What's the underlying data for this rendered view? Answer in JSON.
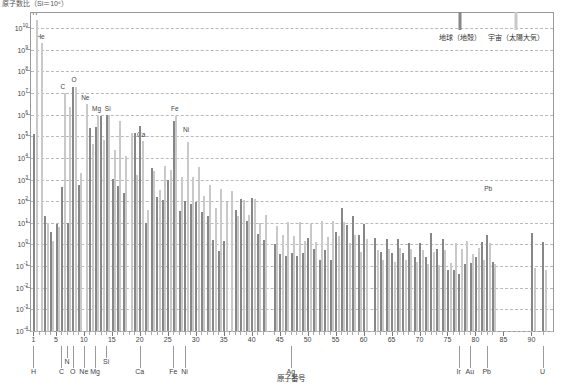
{
  "chart_title": "原子数比（Si＝10⁶）",
  "xaxis_title": "原子番号",
  "legend": {
    "items": [
      {
        "label": "地球（地殻）",
        "color": "#878787",
        "key": "earth"
      },
      {
        "label": "宇宙（太陽大気）",
        "color": "#c9c9c9",
        "key": "solar"
      }
    ]
  },
  "y_ticks": [
    {
      "mantissa": "10",
      "exp": "10"
    },
    {
      "mantissa": "10",
      "exp": "9"
    },
    {
      "mantissa": "10",
      "exp": "8"
    },
    {
      "mantissa": "10",
      "exp": "7"
    },
    {
      "mantissa": "10",
      "exp": "6"
    },
    {
      "mantissa": "10",
      "exp": "5"
    },
    {
      "mantissa": "10",
      "exp": "4"
    },
    {
      "mantissa": "10",
      "exp": "3"
    },
    {
      "mantissa": "10",
      "exp": "2"
    },
    {
      "mantissa": "10",
      "exp": "1"
    },
    {
      "mantissa": "10",
      "exp": "0"
    },
    {
      "mantissa": "10",
      "exp": "-1"
    },
    {
      "mantissa": "10",
      "exp": "-2"
    },
    {
      "mantissa": "10",
      "exp": "-3"
    },
    {
      "mantissa": "10",
      "exp": "-4"
    }
  ],
  "x_ticks": [
    1,
    5,
    10,
    15,
    20,
    25,
    30,
    35,
    40,
    45,
    50,
    55,
    60,
    65,
    70,
    75,
    80,
    85,
    90
  ],
  "element_callouts": [
    {
      "symbol": "H",
      "z": 1,
      "tier": 0
    },
    {
      "symbol": "C",
      "z": 6,
      "tier": 0
    },
    {
      "symbol": "N",
      "z": 7,
      "tier": 1
    },
    {
      "symbol": "O",
      "z": 8,
      "tier": 0
    },
    {
      "symbol": "Ne",
      "z": 10,
      "tier": 0
    },
    {
      "symbol": "Mg",
      "z": 12,
      "tier": 0
    },
    {
      "symbol": "Si",
      "z": 14,
      "tier": 1
    },
    {
      "symbol": "Ca",
      "z": 20,
      "tier": 0
    },
    {
      "symbol": "Fe",
      "z": 26,
      "tier": 0
    },
    {
      "symbol": "Ni",
      "z": 28,
      "tier": 0
    },
    {
      "symbol": "Ag",
      "z": 47,
      "tier": 0
    },
    {
      "symbol": "Ir",
      "z": 77,
      "tier": 0
    },
    {
      "symbol": "Au",
      "z": 79,
      "tier": 0
    },
    {
      "symbol": "Pb",
      "z": 82,
      "tier": 0
    },
    {
      "symbol": "U",
      "z": 92,
      "tier": 0
    }
  ],
  "in_chart_labels": [
    {
      "symbol": "H",
      "z": 1,
      "log": 10.45
    },
    {
      "symbol": "He",
      "z": 2,
      "log": 9.35
    },
    {
      "symbol": "C",
      "z": 6,
      "log": 7.05
    },
    {
      "symbol": "O",
      "z": 8,
      "log": 7.35
    },
    {
      "symbol": "Ne",
      "z": 10,
      "log": 6.55
    },
    {
      "symbol": "Mg",
      "z": 12,
      "log": 6.05
    },
    {
      "symbol": "Si",
      "z": 14,
      "log": 6.05
    },
    {
      "symbol": "Ca",
      "z": 20,
      "log": 4.85
    },
    {
      "symbol": "Fe",
      "z": 26,
      "log": 6.05
    },
    {
      "symbol": "Ni",
      "z": 28,
      "log": 5.05
    },
    {
      "symbol": "Pb",
      "z": 82,
      "log": 2.35
    }
  ],
  "chart_data": {
    "type": "bar",
    "title": "原子数比（Si＝10⁶）",
    "xlabel": "原子番号",
    "ylabel": "原子数比（Si＝10⁶）",
    "ylim_log": [
      -4,
      10.7
    ],
    "xlim": [
      0.2,
      93.5
    ],
    "grid": "horizontal-dashed",
    "legend_position": "top-right",
    "y_scale": "log10",
    "note": "Values are log10 of abundance, Si normalised to 10^6. Two series per atomic number: Earth crust (dark grey) and Solar atmosphere / cosmic (light grey).",
    "categories": [
      1,
      2,
      3,
      4,
      5,
      6,
      7,
      8,
      9,
      10,
      11,
      12,
      13,
      14,
      15,
      16,
      17,
      18,
      19,
      20,
      21,
      22,
      23,
      24,
      25,
      26,
      27,
      28,
      29,
      30,
      31,
      32,
      33,
      34,
      35,
      36,
      37,
      38,
      39,
      40,
      41,
      42,
      44,
      45,
      46,
      47,
      48,
      49,
      50,
      51,
      52,
      53,
      54,
      55,
      56,
      57,
      58,
      59,
      60,
      62,
      63,
      64,
      65,
      66,
      67,
      68,
      69,
      70,
      71,
      72,
      73,
      74,
      75,
      76,
      77,
      78,
      79,
      80,
      81,
      82,
      83,
      90,
      92
    ],
    "series": [
      {
        "name": "地球（地殻）",
        "key": "earth",
        "color": "#878787",
        "log_values": [
          5.1,
          null,
          1.3,
          0.6,
          0.95,
          2.65,
          1.0,
          7.3,
          2.75,
          null,
          5.4,
          5.45,
          5.95,
          6.0,
          3.05,
          2.7,
          2.4,
          null,
          5.15,
          5.5,
          1.0,
          3.55,
          2.2,
          2.05,
          3.0,
          5.7,
          1.55,
          2.0,
          1.85,
          1.95,
          1.5,
          1.3,
          0.2,
          -0.3,
          0.15,
          null,
          1.6,
          2.1,
          1.1,
          2.15,
          0.5,
          0.2,
          0.0,
          -0.45,
          -0.55,
          -0.4,
          -0.55,
          -0.4,
          0.3,
          -0.2,
          -0.7,
          -0.25,
          -0.7,
          0.6,
          1.7,
          0.9,
          1.3,
          0.45,
          0.95,
          0.3,
          -0.35,
          0.25,
          -0.4,
          0.25,
          -0.4,
          0.05,
          -0.6,
          0.05,
          -0.6,
          0.55,
          -0.2,
          0.25,
          -1.2,
          -1.2,
          -1.35,
          -0.9,
          -0.85,
          -0.6,
          0.1,
          0.45,
          -0.8,
          0.55,
          0.1
        ]
      },
      {
        "name": "宇宙（太陽大気）",
        "key": "solar",
        "color": "#c9c9c9",
        "log_values": [
          10.4,
          9.3,
          1.0,
          0.15,
          0.8,
          7.0,
          6.35,
          7.3,
          3.3,
          6.5,
          4.65,
          6.0,
          4.85,
          6.0,
          4.35,
          5.7,
          4.1,
          5.15,
          3.2,
          4.8,
          1.6,
          3.4,
          2.5,
          3.65,
          3.45,
          5.95,
          3.1,
          4.75,
          3.1,
          3.6,
          2.25,
          2.75,
          1.7,
          2.55,
          1.95,
          2.45,
          1.3,
          2.05,
          1.35,
          2.1,
          1.0,
          1.35,
          0.85,
          0.45,
          1.05,
          0.4,
          1.05,
          0.15,
          0.95,
          0.1,
          1.1,
          0.35,
          1.1,
          0.4,
          1.05,
          0.05,
          0.45,
          -0.35,
          0.25,
          -0.25,
          -0.7,
          -0.2,
          -0.8,
          -0.15,
          -0.7,
          -0.2,
          -0.8,
          -0.25,
          -0.9,
          -0.35,
          -0.95,
          -0.25,
          -0.85,
          0.05,
          -0.2,
          0.15,
          -0.45,
          -0.15,
          -0.7,
          0.05,
          -0.9,
          -1.1,
          -1.2
        ]
      }
    ]
  }
}
